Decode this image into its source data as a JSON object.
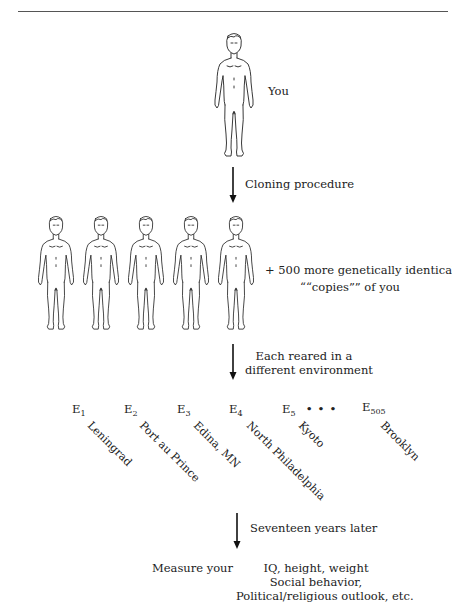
{
  "figure": {
    "original": {
      "label": "You"
    },
    "step1": {
      "label": "Cloning procedure"
    },
    "clones": {
      "count_shown": 5,
      "caption_line1": "+ 500 more genetically identical",
      "caption_line2": "““copies”” of you"
    },
    "step2": {
      "line1": "Each reared in a",
      "line2": "different environment"
    },
    "environments": [
      {
        "symbol": "E",
        "sub": "1",
        "city": "Leningrad"
      },
      {
        "symbol": "E",
        "sub": "2",
        "city": "Port au Prince"
      },
      {
        "symbol": "E",
        "sub": "3",
        "city": "Edina, MN"
      },
      {
        "symbol": "E",
        "sub": "4",
        "city": "North Philadelphia"
      },
      {
        "symbol": "E",
        "sub": "5",
        "city": "Kyoto"
      },
      {
        "symbol": "E",
        "sub": "505",
        "city": "Brooklyn"
      }
    ],
    "ellipsis": "• • •",
    "step3": {
      "label": "Seventeen years later"
    },
    "measure": {
      "prefix": "Measure your",
      "line1": "IQ, height, weight",
      "line2": "Social behavior,",
      "line3": "Political/religious outlook, etc."
    }
  }
}
